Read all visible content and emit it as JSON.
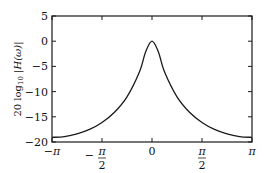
{
  "chart_data": {
    "type": "line",
    "title": "",
    "xlabel": "",
    "ylabel": "20 log10 |H(ω)|",
    "ylabel_parts": {
      "prefix": "20 log",
      "sub": "10",
      "suffix": " |H(ω)|"
    },
    "xlim": [
      -3.14159,
      3.14159
    ],
    "ylim": [
      -20,
      5
    ],
    "grid": false,
    "legend": null,
    "x_ticks": [
      {
        "value": -3.14159,
        "label": "−π"
      },
      {
        "value": -1.5708,
        "label": "−π/2",
        "num": "π",
        "den": "2",
        "sign": "−"
      },
      {
        "value": 0,
        "label": "0"
      },
      {
        "value": 1.5708,
        "label": "π/2",
        "num": "π",
        "den": "2",
        "sign": ""
      },
      {
        "value": 3.14159,
        "label": "π"
      }
    ],
    "y_ticks": [
      {
        "value": 5,
        "label": "5"
      },
      {
        "value": 0,
        "label": "0"
      },
      {
        "value": -5,
        "label": "−5"
      },
      {
        "value": -10,
        "label": "−10"
      },
      {
        "value": -15,
        "label": "−15"
      },
      {
        "value": -20,
        "label": "−20"
      }
    ],
    "series": [
      {
        "name": "20 log10 |H(ω)|",
        "x": [
          -3.14159,
          -2.74889,
          -2.35619,
          -1.9635,
          -1.5708,
          -1.1781,
          -0.7854,
          -0.3927,
          -0.19635,
          0,
          0.19635,
          0.3927,
          0.7854,
          1.1781,
          1.5708,
          1.9635,
          2.35619,
          2.74889,
          3.14159
        ],
        "y": [
          -19.08,
          -18.92,
          -18.41,
          -17.51,
          -16.13,
          -14.1,
          -11.05,
          -6.08,
          -2.05,
          0,
          -2.05,
          -6.08,
          -11.05,
          -14.1,
          -16.13,
          -17.51,
          -18.41,
          -18.92,
          -19.08
        ]
      }
    ],
    "colors": {
      "line": "#1a1a1a",
      "axes": "#1a1a1a",
      "background": "#ffffff"
    }
  }
}
